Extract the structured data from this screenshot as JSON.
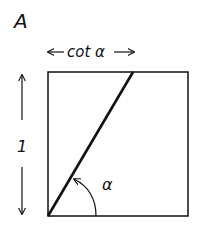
{
  "panel_label": "A",
  "width_label": "cot α",
  "height_label": "1",
  "angle_label": "α",
  "stroke_color": "#111111"
}
